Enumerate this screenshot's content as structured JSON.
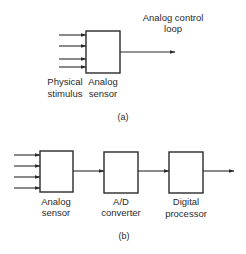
{
  "diagram_a": {
    "caption": "(a)",
    "output_label_line1": "Analog control",
    "output_label_line2": "loop",
    "input_label_line1": "Physical",
    "input_label_line2": "stimulus",
    "block": {
      "line1": "Analog",
      "line2": "sensor"
    },
    "input_arrow_count": 4
  },
  "diagram_b": {
    "caption": "(b)",
    "input_arrow_count": 4,
    "blocks": [
      {
        "line1": "Analog",
        "line2": "sensor"
      },
      {
        "line1": "A/D",
        "line2": "converter"
      },
      {
        "line1": "Digital",
        "line2": "processor"
      }
    ]
  },
  "colors": {
    "ink": "#2a2a2a",
    "background": "#ffffff"
  }
}
